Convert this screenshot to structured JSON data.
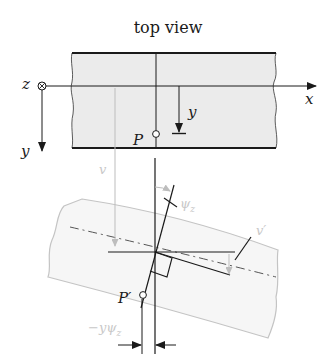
{
  "title": "top view",
  "labels": {
    "z_axis": "z",
    "x_axis": "x",
    "y_axis": "y",
    "y_offset": "y",
    "point_P": "P",
    "point_P_prime": "P′",
    "deflection_v": "v",
    "rotation_psi": "ψ",
    "rotation_psi_sub": "z",
    "slope_v_prime": "v′",
    "shift_label": "−yψ",
    "shift_label_sub": "z"
  },
  "colors": {
    "ink": "#1a1a1a",
    "beam_fill": "#ebebeb",
    "deformed_outline": "#c4c4c4",
    "gray_annotation": "#bdbdbd"
  },
  "icons": {
    "z_axis_symbol": "circled-times (into page)"
  }
}
